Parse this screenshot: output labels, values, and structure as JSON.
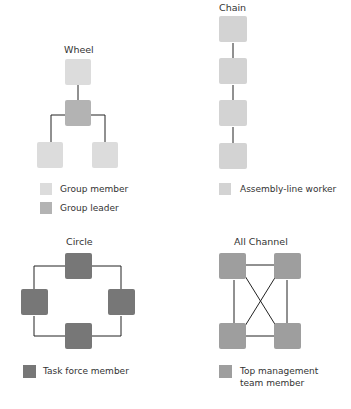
{
  "colors": {
    "group_member": "#dcdcdc",
    "group_leader": "#b3b3b3",
    "assembly_line_worker": "#d3d3d3",
    "task_force_member": "#777777",
    "top_management": "#9e9e9e",
    "line": "#222222"
  },
  "networks": [
    {
      "title": "Wheel",
      "legend": [
        {
          "label": "Group member"
        },
        {
          "label": "Group leader"
        }
      ]
    },
    {
      "title": "Chain",
      "legend": [
        {
          "label": "Assembly-line worker"
        }
      ]
    },
    {
      "title": "Circle",
      "legend": [
        {
          "label": "Task force member"
        }
      ]
    },
    {
      "title": "All Channel",
      "legend": [
        {
          "label": "Top management team member"
        }
      ],
      "legend_lines": [
        "Top management",
        "team member"
      ]
    }
  ]
}
